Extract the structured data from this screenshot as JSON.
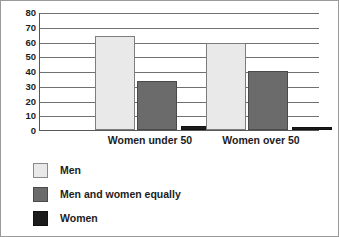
{
  "chart_data": {
    "type": "bar",
    "title": "",
    "subtitle": "",
    "xlabel": "",
    "ylabel": "",
    "ylim": [
      0,
      80
    ],
    "yticks": [
      0,
      10,
      20,
      30,
      40,
      50,
      60,
      70,
      80
    ],
    "ytick_labels": [
      "0",
      "10",
      "20",
      "30",
      "40",
      "50",
      "60",
      "70",
      "80"
    ],
    "grid": true,
    "legend_position": "below-left",
    "categories": [
      "Women under 50",
      "Women over 50"
    ],
    "series": [
      {
        "name": "Men",
        "color": "#e9e9e9",
        "values": [
          64,
          59
        ]
      },
      {
        "name": "Men and women equally",
        "color": "#6b6b6b",
        "values": [
          33,
          40
        ]
      },
      {
        "name": "Women",
        "color": "#1b1b1b",
        "values": [
          3,
          2
        ]
      }
    ]
  },
  "legend": {
    "items": [
      {
        "label": "Men",
        "swatch": "men"
      },
      {
        "label": "Men and women equally",
        "swatch": "equal"
      },
      {
        "label": "Women",
        "swatch": "women"
      }
    ]
  }
}
